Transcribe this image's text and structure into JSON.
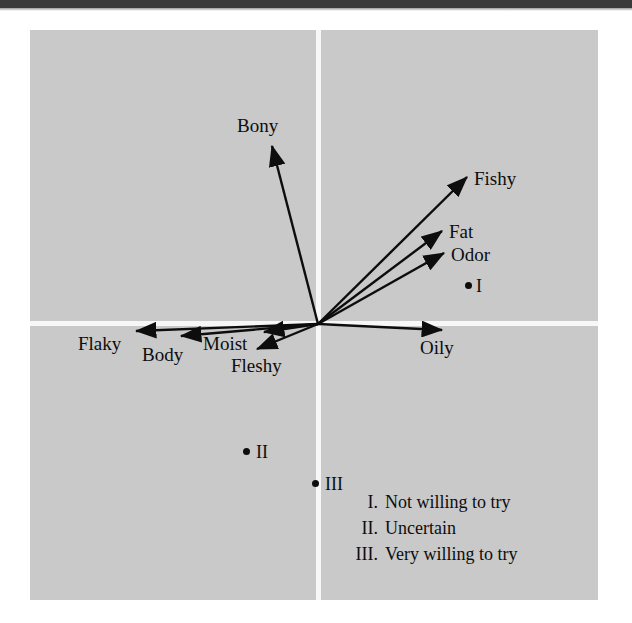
{
  "figure": {
    "background_color": "#ffffff",
    "plot_background_color": "#c9c9c9",
    "axis_color": "#f7f7f7",
    "ink_color": "#0d0d0d"
  },
  "chart_data": {
    "type": "scatter",
    "title": "",
    "xlabel": "",
    "ylabel": "",
    "grid": false,
    "legend_position": "bottom-right",
    "axis_style": "crosshair-at-origin",
    "origin": {
      "x": 318,
      "y": 324
    },
    "xlim": [
      30,
      598
    ],
    "ylim": [
      30,
      600
    ],
    "vectors": [
      {
        "name": "Bony",
        "label": "Bony",
        "tip": {
          "x": 272,
          "y": 146
        },
        "label_pos": {
          "x": 237,
          "y": 116
        }
      },
      {
        "name": "Fishy",
        "label": "Fishy",
        "tip": {
          "x": 467,
          "y": 177
        },
        "label_pos": {
          "x": 474,
          "y": 169
        }
      },
      {
        "name": "Fat",
        "label": "Fat",
        "tip": {
          "x": 442,
          "y": 231
        },
        "label_pos": {
          "x": 449,
          "y": 222
        }
      },
      {
        "name": "Odor",
        "label": "Odor",
        "tip": {
          "x": 444,
          "y": 253
        },
        "label_pos": {
          "x": 451,
          "y": 245
        }
      },
      {
        "name": "Oily",
        "label": "Oily",
        "tip": {
          "x": 442,
          "y": 330
        },
        "label_pos": {
          "x": 420,
          "y": 338
        }
      },
      {
        "name": "Flaky",
        "label": "Flaky",
        "tip": {
          "x": 136,
          "y": 331
        },
        "label_pos": {
          "x": 78,
          "y": 334
        }
      },
      {
        "name": "Body",
        "label": "Body",
        "tip": {
          "x": 181,
          "y": 336
        },
        "label_pos": {
          "x": 142,
          "y": 345
        }
      },
      {
        "name": "Moist",
        "label": "Moist",
        "tip": {
          "x": 264,
          "y": 332
        },
        "label_pos": {
          "x": 203,
          "y": 334
        }
      },
      {
        "name": "Fleshy",
        "label": "Fleshy",
        "tip": {
          "x": 257,
          "y": 349
        },
        "label_pos": {
          "x": 231,
          "y": 356
        }
      }
    ],
    "points": [
      {
        "name": "I",
        "label": "I",
        "x": 468,
        "y": 285,
        "label_pos": {
          "x": 476,
          "y": 277
        }
      },
      {
        "name": "II",
        "label": "II",
        "x": 246,
        "y": 451,
        "label_pos": {
          "x": 256,
          "y": 443
        }
      },
      {
        "name": "III",
        "label": "III",
        "x": 315,
        "y": 483,
        "label_pos": {
          "x": 325,
          "y": 475
        }
      }
    ]
  },
  "legend": {
    "entries": [
      {
        "numeral": "I.",
        "text": "Not willing to try"
      },
      {
        "numeral": "II.",
        "text": "Uncertain"
      },
      {
        "numeral": "III.",
        "text": "Very willing to try"
      }
    ]
  }
}
